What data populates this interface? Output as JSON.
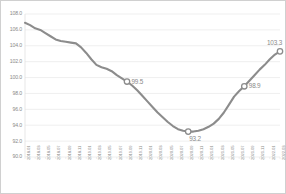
{
  "chart_data": {
    "type": "line",
    "title": "",
    "subtitle": "",
    "xlabel": "",
    "ylabel": "",
    "ylim": [
      90.0,
      108.0
    ],
    "ytick_step": 2.0,
    "grid": "horizontal",
    "legend": "none",
    "line_color": "#8c8c8c",
    "marker_color": "#8c8c8c",
    "gridline_color": "#e8e8e8",
    "axis_text_color": "#8a8a8a",
    "background": "#ffffff",
    "border_color": "#d0d0d0",
    "ytick_labels": [
      "108.0",
      "106.0",
      "104.0",
      "102.0",
      "100.0",
      "98.0",
      "96.0",
      "94.0",
      "92.0",
      "90.0"
    ],
    "ytick_values": [
      108.0,
      106.0,
      104.0,
      102.0,
      100.0,
      98.0,
      96.0,
      94.0,
      92.0,
      90.0
    ],
    "xtick_labels": [
      "2018.01",
      "2018.03",
      "2018.05",
      "2018.07",
      "2018.09",
      "2018.11",
      "2019.01",
      "2019.03",
      "2019.05",
      "2019.07",
      "2019.09",
      "2019.11",
      "2020.01",
      "2020.03",
      "2020.05",
      "2020.07",
      "2020.09",
      "2020.11",
      "2021.01",
      "2021.03",
      "2021.05",
      "2021.07",
      "2021.09",
      "2021.11",
      "2022.01",
      "2022.03"
    ],
    "x": [
      "2018.01",
      "2018.02",
      "2018.03",
      "2018.04",
      "2018.05",
      "2018.06",
      "2018.07",
      "2018.08",
      "2018.09",
      "2018.10",
      "2018.11",
      "2018.12",
      "2019.01",
      "2019.02",
      "2019.03",
      "2019.04",
      "2019.05",
      "2019.06",
      "2019.07",
      "2019.08",
      "2019.09",
      "2019.10",
      "2019.11",
      "2019.12",
      "2020.01",
      "2020.02",
      "2020.03",
      "2020.04",
      "2020.05",
      "2020.06",
      "2020.07",
      "2020.08",
      "2020.09",
      "2020.10",
      "2020.11",
      "2020.12",
      "2021.01",
      "2021.02",
      "2021.03",
      "2021.04",
      "2021.05",
      "2021.06",
      "2021.07",
      "2021.08",
      "2021.09",
      "2021.10",
      "2021.11",
      "2021.12",
      "2022.01",
      "2022.02",
      "2022.03"
    ],
    "values": [
      106.9,
      106.6,
      106.2,
      106.0,
      105.6,
      105.2,
      104.8,
      104.6,
      104.5,
      104.4,
      104.3,
      103.8,
      103.1,
      102.3,
      101.6,
      101.3,
      101.1,
      100.8,
      100.3,
      99.9,
      99.5,
      99.0,
      98.4,
      97.7,
      97.0,
      96.3,
      95.6,
      95.0,
      94.4,
      93.9,
      93.5,
      93.3,
      93.2,
      93.2,
      93.3,
      93.5,
      93.8,
      94.2,
      94.8,
      95.6,
      96.6,
      97.6,
      98.3,
      98.9,
      99.6,
      100.3,
      101.0,
      101.6,
      102.3,
      102.9,
      103.3
    ],
    "point_labels": [
      {
        "x": "2019.09",
        "value": 99.5,
        "text": "99.5"
      },
      {
        "x": "2020.09",
        "value": 93.2,
        "text": "93.2"
      },
      {
        "x": "2021.08",
        "value": 98.9,
        "text": "98.9"
      },
      {
        "x": "2022.03",
        "value": 103.3,
        "text": "103.3"
      }
    ]
  }
}
